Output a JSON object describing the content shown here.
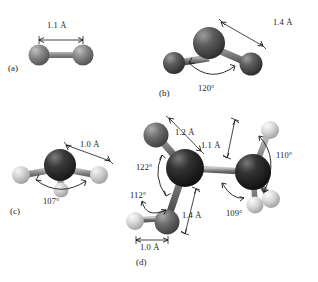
{
  "figure": {
    "background_color": "#ffffff",
    "atom_colors": {
      "black": "#111111",
      "dark_gray": "#4a4a4a",
      "medium_gray": "#6e6e6e",
      "light_gray": "#c9c9c9",
      "white_sphere": "#dcdcdc",
      "bond": "#8a8a8a",
      "annotation": "#1a1a1a"
    }
  },
  "panels": [
    {
      "id": "a",
      "caption": "(a)",
      "description": "linear diatomic molecule",
      "atoms": [
        {
          "name": "atom-left",
          "shade": "medium_gray"
        },
        {
          "name": "atom-right",
          "shade": "medium_gray"
        }
      ],
      "bond_lengths": [
        {
          "name": "bond-length-a-1",
          "value": "1.1 Å"
        }
      ],
      "angles": []
    },
    {
      "id": "b",
      "caption": "(b)",
      "description": "bent triatomic molecule",
      "atoms": [
        {
          "name": "atom-center",
          "shade": "dark_gray"
        },
        {
          "name": "atom-left",
          "shade": "dark_gray"
        },
        {
          "name": "atom-right",
          "shade": "dark_gray"
        }
      ],
      "bond_lengths": [
        {
          "name": "bond-length-b-1",
          "value": "1.4 Å"
        }
      ],
      "angles": [
        {
          "name": "bond-angle-b-1",
          "value": "120°"
        }
      ]
    },
    {
      "id": "c",
      "caption": "(c)",
      "description": "pyramidal molecule with three light atoms",
      "atoms": [
        {
          "name": "atom-center",
          "shade": "black"
        },
        {
          "name": "atom-left",
          "shade": "light_gray"
        },
        {
          "name": "atom-right",
          "shade": "light_gray"
        },
        {
          "name": "atom-front",
          "shade": "light_gray"
        }
      ],
      "bond_lengths": [
        {
          "name": "bond-length-c-1",
          "value": "1.0 Å"
        }
      ],
      "angles": [
        {
          "name": "bond-angle-c-1",
          "value": "107°"
        }
      ]
    },
    {
      "id": "d",
      "caption": "(d)",
      "description": "two-center molecule with mixed substituents",
      "atoms": [
        {
          "name": "atom-center-left",
          "shade": "black"
        },
        {
          "name": "atom-center-right",
          "shade": "black"
        },
        {
          "name": "atom-upper-left",
          "shade": "medium_gray"
        },
        {
          "name": "atom-lower-left",
          "shade": "medium_gray"
        },
        {
          "name": "atom-far-left",
          "shade": "light_gray"
        },
        {
          "name": "atom-upper-right",
          "shade": "white_sphere"
        },
        {
          "name": "atom-lower-right-1",
          "shade": "white_sphere"
        },
        {
          "name": "atom-lower-right-2",
          "shade": "white_sphere"
        }
      ],
      "bond_lengths": [
        {
          "name": "bond-length-d-1",
          "value": "1.2 Å"
        },
        {
          "name": "bond-length-d-2",
          "value": "1.1 Å"
        },
        {
          "name": "bond-length-d-3",
          "value": "1.4 Å"
        },
        {
          "name": "bond-length-d-4",
          "value": "1.0 Å"
        }
      ],
      "angles": [
        {
          "name": "bond-angle-d-1",
          "value": "122°"
        },
        {
          "name": "bond-angle-d-2",
          "value": "112°"
        },
        {
          "name": "bond-angle-d-3",
          "value": "109°"
        },
        {
          "name": "bond-angle-d-4",
          "value": "110°"
        }
      ]
    }
  ]
}
